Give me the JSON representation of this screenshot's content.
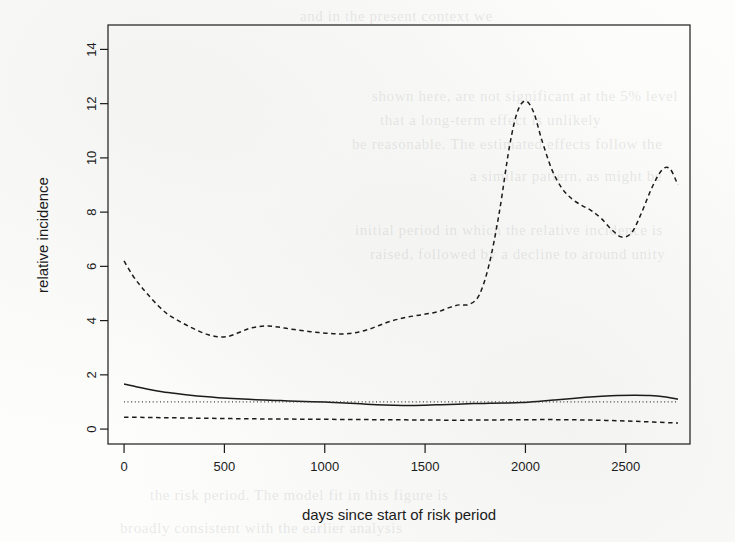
{
  "page": {
    "background_color": "#fdfdfc",
    "ghost_lines": [
      {
        "text": "and in the present context we"
      },
      {
        "text": "shown here, are not significant at the 5% level"
      },
      {
        "text": "that a long-term effect is unlikely"
      },
      {
        "text": "be reasonable. The estimated effects follow the"
      },
      {
        "text": "a similar pattern, as might be"
      },
      {
        "text": "initial period in which the relative incidence is"
      },
      {
        "text": "raised, followed by a decline to around unity"
      },
      {
        "text": "the risk period. The model fit in this figure is"
      },
      {
        "text": "broadly consistent with the earlier analysis"
      }
    ]
  },
  "chart_data": {
    "type": "line",
    "title": "",
    "xlabel": "days since start of risk period",
    "ylabel": "relative incidence",
    "xlim": [
      -80,
      2820
    ],
    "ylim": [
      -0.55,
      14.9
    ],
    "xticks": [
      0,
      500,
      1000,
      1500,
      2000,
      2500
    ],
    "yticks": [
      0,
      2,
      4,
      6,
      8,
      10,
      12,
      14
    ],
    "xtick_labels": [
      "0",
      "500",
      "1000",
      "1500",
      "2000",
      "2500"
    ],
    "ytick_labels": [
      "0",
      "2",
      "4",
      "6",
      "8",
      "10",
      "12",
      "14"
    ],
    "grid": false,
    "legend": "none",
    "box": true,
    "series": [
      {
        "name": "upper 95% confidence limit",
        "style": "dashed",
        "color": "#1b1b1b",
        "x": [
          0,
          40,
          80,
          120,
          170,
          220,
          270,
          320,
          370,
          420,
          470,
          520,
          570,
          620,
          670,
          720,
          770,
          820,
          870,
          920,
          970,
          1020,
          1070,
          1120,
          1170,
          1220,
          1270,
          1320,
          1370,
          1420,
          1470,
          1520,
          1570,
          1620,
          1670,
          1720,
          1770,
          1820,
          1870,
          1920,
          1960,
          2000,
          2040,
          2080,
          2130,
          2180,
          2230,
          2280,
          2330,
          2380,
          2430,
          2480,
          2530,
          2580,
          2630,
          2680,
          2720,
          2760
        ],
        "y": [
          6.2,
          5.7,
          5.3,
          4.95,
          4.55,
          4.22,
          4.0,
          3.8,
          3.62,
          3.48,
          3.4,
          3.42,
          3.55,
          3.7,
          3.78,
          3.8,
          3.76,
          3.7,
          3.65,
          3.6,
          3.56,
          3.53,
          3.51,
          3.52,
          3.58,
          3.68,
          3.82,
          3.96,
          4.06,
          4.14,
          4.2,
          4.26,
          4.34,
          4.48,
          4.58,
          4.6,
          4.95,
          6.1,
          8.0,
          10.4,
          11.7,
          12.1,
          11.7,
          10.7,
          9.6,
          8.9,
          8.5,
          8.25,
          8.05,
          7.75,
          7.35,
          7.08,
          7.25,
          8.0,
          8.9,
          9.55,
          9.6,
          9.0
        ],
        "label_positions": []
      },
      {
        "name": "estimated relative incidence",
        "style": "solid",
        "color": "#1b1b1b",
        "x": [
          0,
          60,
          120,
          190,
          260,
          330,
          400,
          470,
          540,
          620,
          700,
          780,
          860,
          940,
          1020,
          1100,
          1180,
          1260,
          1340,
          1420,
          1500,
          1580,
          1660,
          1740,
          1820,
          1900,
          1980,
          2060,
          2140,
          2220,
          2300,
          2380,
          2460,
          2540,
          2620,
          2700,
          2760
        ],
        "y": [
          1.66,
          1.56,
          1.47,
          1.38,
          1.31,
          1.25,
          1.2,
          1.16,
          1.13,
          1.1,
          1.07,
          1.05,
          1.03,
          1.01,
          0.99,
          0.96,
          0.93,
          0.9,
          0.88,
          0.87,
          0.88,
          0.9,
          0.92,
          0.94,
          0.95,
          0.96,
          0.98,
          1.02,
          1.07,
          1.12,
          1.17,
          1.21,
          1.24,
          1.25,
          1.24,
          1.18,
          1.1
        ],
        "label_positions": []
      },
      {
        "name": "null reference line",
        "style": "dotted",
        "color": "#3a3a3a",
        "x": [
          0,
          2760
        ],
        "y": [
          1.0,
          1.0
        ],
        "label_positions": []
      },
      {
        "name": "lower 95% confidence limit",
        "style": "dashed",
        "color": "#1b1b1b",
        "x": [
          0,
          100,
          200,
          300,
          400,
          500,
          600,
          700,
          800,
          900,
          1000,
          1100,
          1200,
          1300,
          1400,
          1500,
          1600,
          1700,
          1800,
          1900,
          2000,
          2100,
          2200,
          2300,
          2400,
          2500,
          2600,
          2700,
          2760
        ],
        "y": [
          0.44,
          0.43,
          0.42,
          0.41,
          0.4,
          0.39,
          0.38,
          0.375,
          0.37,
          0.365,
          0.36,
          0.355,
          0.35,
          0.345,
          0.34,
          0.335,
          0.33,
          0.33,
          0.335,
          0.34,
          0.345,
          0.35,
          0.345,
          0.335,
          0.32,
          0.3,
          0.27,
          0.24,
          0.22
        ],
        "label_positions": []
      }
    ]
  }
}
